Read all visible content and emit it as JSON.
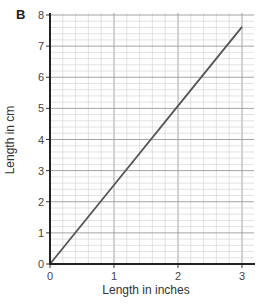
{
  "panel_label": "B",
  "chart_data": {
    "type": "line",
    "title": "",
    "xlabel": "Length in inches",
    "ylabel": "Length in cm",
    "xlim": [
      0,
      3
    ],
    "ylim": [
      0,
      8
    ],
    "x_ticks": [
      0,
      1,
      2,
      3
    ],
    "y_ticks": [
      0,
      1,
      2,
      3,
      4,
      5,
      6,
      7,
      8
    ],
    "grid": true,
    "grid_minor_per_major": 5,
    "legend": null,
    "series": [
      {
        "name": "inches to cm conversion",
        "x": [
          0,
          1,
          2,
          3
        ],
        "y": [
          0,
          2.54,
          5.08,
          7.62
        ],
        "color": "#555555"
      }
    ]
  }
}
